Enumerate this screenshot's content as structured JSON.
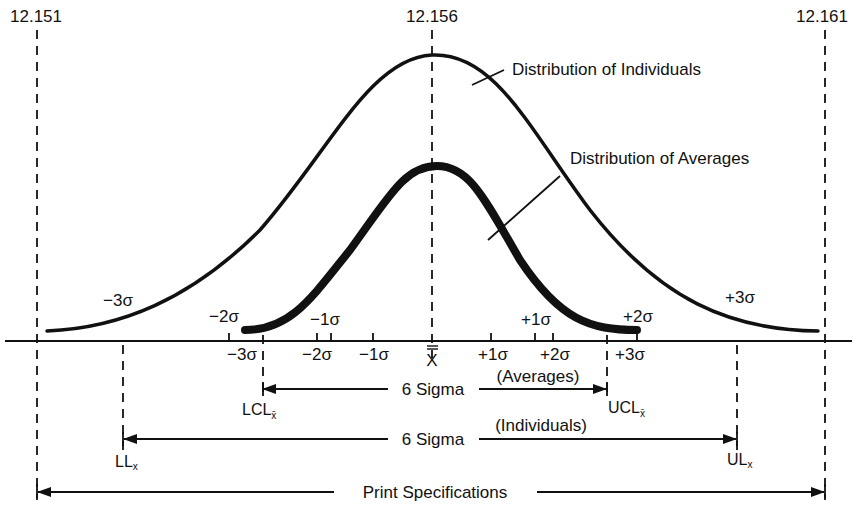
{
  "colors": {
    "ink": "#111111",
    "background": "#ffffff"
  },
  "spec_values": {
    "lower": "12.151",
    "nominal": "12.156",
    "upper": "12.161"
  },
  "curve_labels": {
    "individuals": "Distribution of Individuals",
    "averages": "Distribution of Averages"
  },
  "individual_sigma_labels": {
    "minus3": "−3σ",
    "plus3": "+3σ"
  },
  "average_curve_sigma_labels": {
    "minus2": "−2σ",
    "minus1": "−1σ",
    "plus1": "+1σ",
    "plus2": "+2σ"
  },
  "axis_tick_labels": {
    "minus3": "−3σ",
    "minus2": "−2σ",
    "minus1": "−1σ",
    "center": "X",
    "plus1": "+1σ",
    "plus2": "+2σ",
    "plus3": "+3σ"
  },
  "limits": {
    "lcl": "LCL",
    "lcl_sub": "x̄",
    "ucl": "UCL",
    "ucl_sub": "x̄",
    "ll": "LL",
    "ll_sub": "x",
    "ul": "UL",
    "ul_sub": "x"
  },
  "spans": {
    "averages_label": "6 Sigma",
    "averages_caption": "(Averages)",
    "individuals_label": "6 Sigma",
    "individuals_caption": "(Individuals)",
    "print_spec_label": "Print Specifications"
  }
}
